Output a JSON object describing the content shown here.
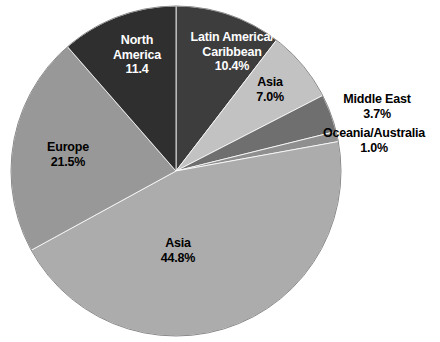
{
  "chart_data": {
    "type": "pie",
    "title": "",
    "subtitle": "",
    "xlabel": "",
    "ylabel": "",
    "legend_position": "none",
    "grid": false,
    "units": "percent",
    "categories": [
      "Latin America/Caribbean",
      "Asia",
      "Middle East",
      "Oceania/Australia",
      "Asia",
      "Europe",
      "North America"
    ],
    "values": [
      10.4,
      7.0,
      3.7,
      1.0,
      44.8,
      21.5,
      11.4
    ],
    "colors": [
      "#3d3d3d",
      "#c2c2c2",
      "#6f6f6f",
      "#8f8f8f",
      "#acacac",
      "#989898",
      "#2f2f2f"
    ],
    "start_angle_deg": 0,
    "direction": "clockwise",
    "slices": [
      {
        "id": "latin-america-caribbean",
        "name": "Latin America/Caribbean",
        "value": 10.4,
        "value_label": "10.4%",
        "label_lines": [
          "Latin America/",
          "Caribbean",
          "10.4%"
        ],
        "color": "#3d3d3d",
        "label_color": "light",
        "label_inside": true
      },
      {
        "id": "asia-7",
        "name": "Asia",
        "value": 7.0,
        "value_label": "7.0%",
        "label_lines": [
          "Asia",
          "7.0%"
        ],
        "color": "#c2c2c2",
        "label_color": "dark",
        "label_inside": true
      },
      {
        "id": "middle-east",
        "name": "Middle East",
        "value": 3.7,
        "value_label": "3.7%",
        "label_lines": [
          "Middle East",
          "3.7%"
        ],
        "color": "#6f6f6f",
        "label_color": "dark",
        "label_inside": false
      },
      {
        "id": "oceania-australia",
        "name": "Oceania/Australia",
        "value": 1.0,
        "value_label": "1.0%",
        "label_lines": [
          "Oceania/Australia",
          "1.0%"
        ],
        "color": "#8f8f8f",
        "label_color": "dark",
        "label_inside": false
      },
      {
        "id": "asia-44",
        "name": "Asia",
        "value": 44.8,
        "value_label": "44.8%",
        "label_lines": [
          "Asia",
          "44.8%"
        ],
        "color": "#acacac",
        "label_color": "dark",
        "label_inside": true
      },
      {
        "id": "europe",
        "name": "Europe",
        "value": 21.5,
        "value_label": "21.5%",
        "label_lines": [
          "Europe",
          "21.5%"
        ],
        "color": "#989898",
        "label_color": "dark",
        "label_inside": true
      },
      {
        "id": "north-america",
        "name": "North America",
        "value": 11.4,
        "value_label": "11.4",
        "label_lines": [
          "North",
          "America",
          "11.4"
        ],
        "color": "#2f2f2f",
        "label_color": "light",
        "label_inside": true
      }
    ]
  }
}
